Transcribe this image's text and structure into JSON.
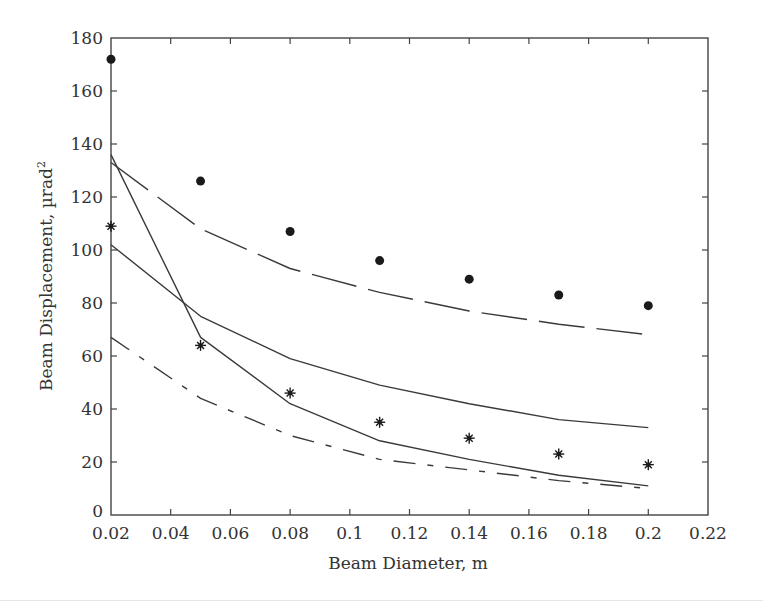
{
  "chart_data": {
    "type": "line",
    "title": "",
    "xlabel": "Beam Diameter, m",
    "ylabel": "Beam Displacement, µrad²",
    "ylabel_base": "Beam Displacement, µrad",
    "ylabel_sup": "2",
    "xlim": [
      0.02,
      0.22
    ],
    "ylim": [
      0,
      180
    ],
    "x_ticks": [
      "0.02",
      "0.04",
      "0.06",
      "0.08",
      "0.1",
      "0.12",
      "0.14",
      "0.16",
      "0.18",
      "0.2",
      "0.22"
    ],
    "y_ticks": [
      "0",
      "20",
      "40",
      "60",
      "80",
      "100",
      "120",
      "140",
      "160",
      "180"
    ],
    "grid": false,
    "legend": "none",
    "x": [
      0.02,
      0.05,
      0.08,
      0.11,
      0.14,
      0.17,
      0.2
    ],
    "series": [
      {
        "name": "measured-dots",
        "style": "marker-dot",
        "values": [
          172,
          126,
          107,
          96,
          89,
          83,
          79
        ]
      },
      {
        "name": "measured-stars",
        "style": "marker-star",
        "values": [
          109,
          64,
          46,
          35,
          29,
          23,
          19
        ]
      },
      {
        "name": "long-dash-curve",
        "style": "long-dash",
        "values": [
          133,
          108,
          93,
          84,
          77,
          72,
          68
        ]
      },
      {
        "name": "solid-upper-curve",
        "style": "solid",
        "values": [
          102,
          75,
          59,
          49,
          42,
          36,
          33
        ]
      },
      {
        "name": "solid-steep-curve",
        "style": "solid",
        "values": [
          136,
          67,
          42,
          28,
          21,
          15,
          11
        ]
      },
      {
        "name": "dash-dot-curve",
        "style": "dash-dot",
        "values": [
          67,
          44,
          30,
          21,
          17,
          13,
          10
        ]
      }
    ]
  },
  "colors": {
    "line": "#3a3a3a",
    "marker": "#1a1a1a",
    "axis": "#444444"
  }
}
